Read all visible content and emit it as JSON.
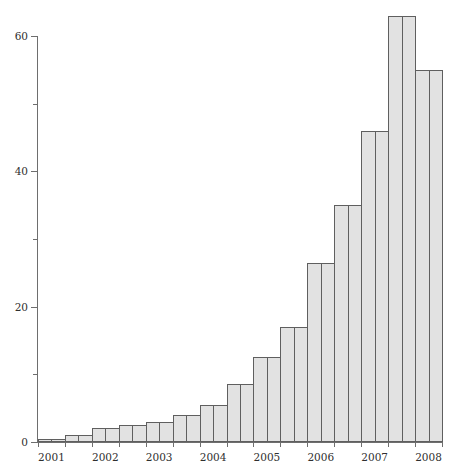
{
  "chart_data": {
    "type": "bar",
    "title": "",
    "subtitle": "",
    "xlabel": "",
    "ylabel": "",
    "grid": false,
    "legend": null,
    "xlim_labels": [
      "2001",
      "2002",
      "2003",
      "2004",
      "2005",
      "2006",
      "2007",
      "2008"
    ],
    "ylim": [
      0,
      63
    ],
    "y_ticks_major": [
      0,
      20,
      40,
      60
    ],
    "y_tick_labels": [
      "0",
      "20",
      "40",
      "60"
    ],
    "y_ticks_minor": [
      10,
      30,
      50
    ],
    "x_tick_labels": [
      "2001",
      "2002",
      "2003",
      "2004",
      "2005",
      "2006",
      "2007",
      "2008"
    ],
    "n_bars": 30,
    "values": [
      0.5,
      0.5,
      1.0,
      1.0,
      2.0,
      2.0,
      2.5,
      2.5,
      3.0,
      3.0,
      4.0,
      4.0,
      5.5,
      5.5,
      8.5,
      8.5,
      12.5,
      12.5,
      17.0,
      17.0,
      26.5,
      26.5,
      35.0,
      35.0,
      46.0,
      46.0,
      63.0,
      63.0,
      55.0,
      55.0
    ],
    "bar_fill_color": "#e2e2e2",
    "bar_edge_color": "#5f5f5f",
    "axis_color": "#6e6e6e",
    "background_color": "#ffffff"
  },
  "axes": {
    "y_label_60": "60",
    "y_label_40": "40",
    "y_label_20": "20",
    "y_label_0": "0",
    "x_label_2001": "2001",
    "x_label_2002": "2002",
    "x_label_2003": "2003",
    "x_label_2004": "2004",
    "x_label_2005": "2005",
    "x_label_2006": "2006",
    "x_label_2007": "2007",
    "x_label_2008": "2008"
  }
}
